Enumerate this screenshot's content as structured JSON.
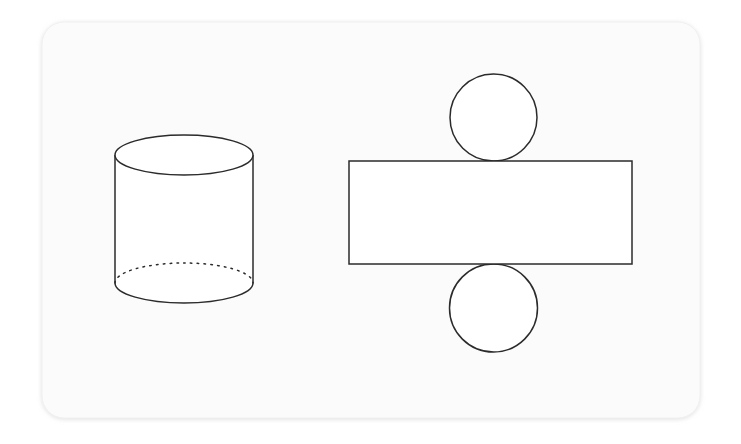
{
  "page": {
    "width": 741,
    "height": 444,
    "background_color": "#ffffff"
  },
  "card": {
    "name": "figure-card",
    "x": 42,
    "y": 22,
    "width": 658,
    "height": 396,
    "corner_radius": 22,
    "fill_color": "#fbfbfb",
    "border_color": "#f0f0f0"
  },
  "style": {
    "stroke_color": "#2b2b2b",
    "stroke_width": 1.5,
    "shape_fill": "#ffffff",
    "hidden_edge_dash": "1.6 5.2",
    "hidden_edge_linecap": "round"
  },
  "figures": [
    {
      "name": "cylinder",
      "label": "Cylinder",
      "type": "3d-solid",
      "center_x": 184,
      "radius_x": 69,
      "radius_y": 20,
      "top_center_y": 155,
      "bottom_center_y": 283,
      "body_height": 128,
      "parts": [
        {
          "name": "cylinder-top-ellipse",
          "kind": "ellipse",
          "visible": "solid"
        },
        {
          "name": "cylinder-left-side",
          "kind": "line",
          "visible": "solid"
        },
        {
          "name": "cylinder-right-side",
          "kind": "line",
          "visible": "solid"
        },
        {
          "name": "cylinder-bottom-front-arc",
          "kind": "arc",
          "visible": "solid"
        },
        {
          "name": "cylinder-bottom-hidden-arc",
          "kind": "arc",
          "visible": "dotted"
        }
      ]
    },
    {
      "name": "cylinder-net",
      "label": "Net of a cylinder",
      "type": "2d-net",
      "rectangle": {
        "name": "net-rectangle",
        "label": "Lateral surface rectangle",
        "x": 349,
        "y": 161,
        "width": 283,
        "height": 103
      },
      "circles": [
        {
          "name": "net-circle-top",
          "label": "Top base circle",
          "center_x": 493.5,
          "center_y": 117.5,
          "radius": 43.5
        },
        {
          "name": "net-circle-bottom",
          "label": "Bottom base circle",
          "center_x": 493.5,
          "center_y": 308,
          "radius": 44
        }
      ]
    }
  ]
}
